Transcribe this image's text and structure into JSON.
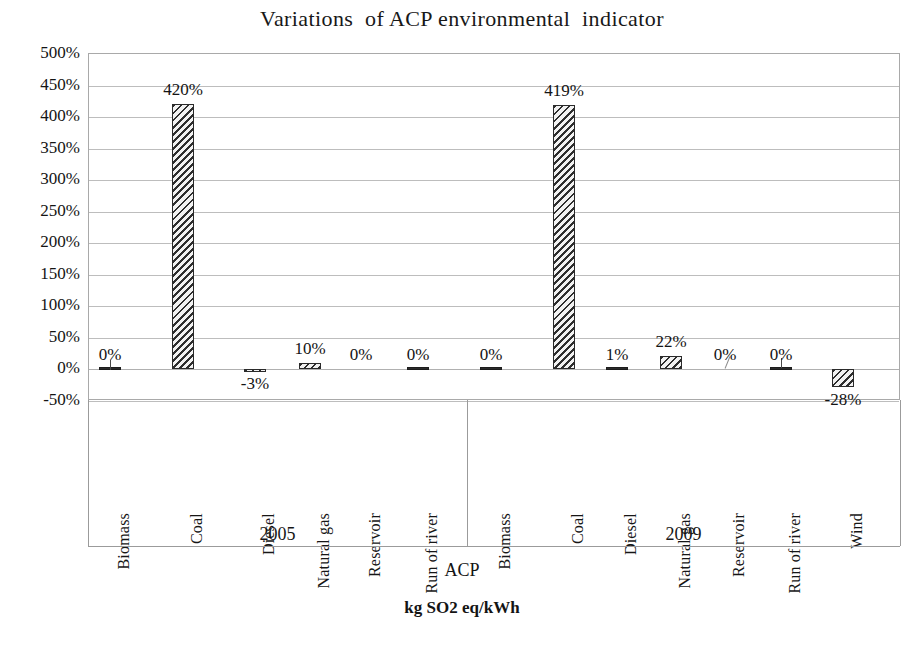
{
  "chart_data": {
    "type": "bar",
    "title": "Variations  of ACP environmental  indicator",
    "xlabel": "ACP",
    "xlabel_units": "kg SO2 eq/kWh",
    "ylabel": "",
    "ylim": [
      -50,
      500
    ],
    "ytick_step": 50,
    "ytick_labels": [
      "500%",
      "450%",
      "400%",
      "350%",
      "300%",
      "250%",
      "200%",
      "150%",
      "100%",
      "50%",
      "0%",
      "-50%"
    ],
    "ytick_values": [
      500,
      450,
      400,
      350,
      300,
      250,
      200,
      150,
      100,
      50,
      0,
      -50
    ],
    "grid": true,
    "legend": false,
    "legend_position": "none",
    "groups": [
      {
        "name": "2005",
        "categories": [
          "Biomass",
          "Coal",
          "Diesel",
          "Natural gas",
          "Reservoir",
          "Run of river"
        ],
        "values": [
          0,
          420,
          -3,
          10,
          0,
          0
        ],
        "labels": [
          "0%",
          "420%",
          "-3%",
          "10%",
          "0%",
          "0%"
        ]
      },
      {
        "name": "2009",
        "categories": [
          "Biomass",
          "Coal",
          "Diesel",
          "Natural gas",
          "Reservoir",
          "Run of river",
          "Wind"
        ],
        "values": [
          0,
          419,
          1,
          22,
          0,
          0,
          -28
        ],
        "labels": [
          "0%",
          "419%",
          "1%",
          "22%",
          "0%",
          "0%",
          "-28%"
        ]
      }
    ],
    "series": [
      {
        "name": "ACP variation",
        "categories": [
          "2005 Biomass",
          "2005 Coal",
          "2005 Diesel",
          "2005 Natural gas",
          "2005 Reservoir",
          "2005 Run of river",
          "2009 Biomass",
          "2009 Coal",
          "2009 Diesel",
          "2009 Natural gas",
          "2009 Reservoir",
          "2009 Run of river",
          "2009 Wind"
        ],
        "values": [
          0,
          420,
          -3,
          10,
          0,
          0,
          0,
          419,
          1,
          22,
          0,
          0,
          -28
        ]
      }
    ],
    "colors": {
      "bar_fill": "#f2f2f2",
      "bar_hatch": "#2e2e2e",
      "bar_border": "#2a2a2a",
      "grid": "#bdbdbd",
      "text": "#141414"
    }
  }
}
